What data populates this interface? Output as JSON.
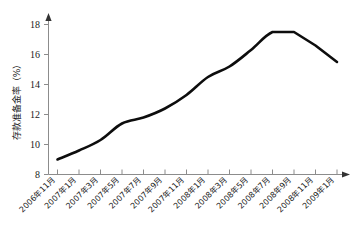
{
  "chart_data": {
    "type": "line",
    "title": "",
    "xlabel": "",
    "ylabel": "存款准备金率（%）",
    "ylim": [
      8,
      18
    ],
    "yticks": [
      8,
      10,
      12,
      14,
      16,
      18
    ],
    "ytick_labels": [
      "8",
      "10",
      "12",
      "14",
      "16",
      "18"
    ],
    "grid": false,
    "legend": null,
    "categories": [
      "2006年11月",
      "2007年1月",
      "2007年3月",
      "2007年5月",
      "2007年7月",
      "2007年9月",
      "2007年11月",
      "2008年1月",
      "2008年3月",
      "2008年5月",
      "2008年7月",
      "2008年9月",
      "2008年11月",
      "2009年1月"
    ],
    "series": [
      {
        "name": "存款准备金率",
        "values": [
          9.0,
          9.6,
          10.3,
          11.4,
          11.8,
          12.4,
          13.3,
          14.5,
          15.2,
          16.3,
          17.5,
          17.5,
          16.6,
          15.5
        ]
      }
    ],
    "colors": {
      "line": "#0d0d0d",
      "axis": "#8c8c8c",
      "text": "#1a1a1a",
      "background": "#ffffff"
    },
    "annotations": []
  }
}
